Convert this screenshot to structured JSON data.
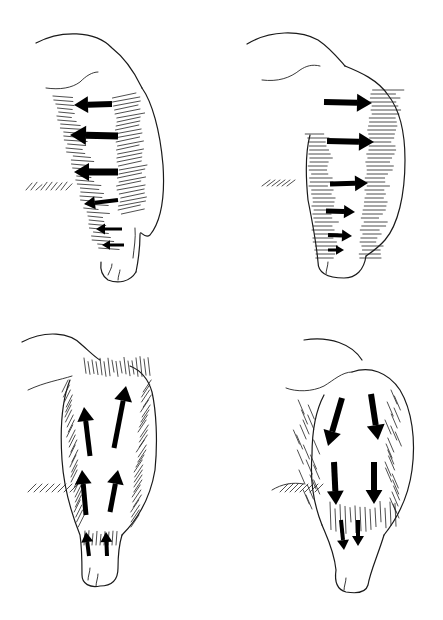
{
  "diagram": {
    "ink_color": "#000000",
    "background_color": "#ffffff",
    "panels": [
      {
        "id": "top-left",
        "view": "lateral",
        "arrow_direction": "left",
        "arrow_count": 6
      },
      {
        "id": "top-right",
        "view": "lateral",
        "arrow_direction": "right",
        "arrow_count": 6
      },
      {
        "id": "bottom-left",
        "view": "front",
        "arrow_direction": "up",
        "arrow_count": 6
      },
      {
        "id": "bottom-right",
        "view": "front",
        "arrow_direction": "down",
        "arrow_count": 6
      }
    ]
  }
}
